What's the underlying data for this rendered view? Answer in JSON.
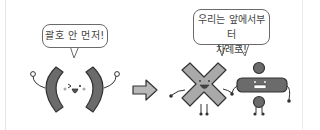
{
  "scene": {
    "left_group": {
      "character": "parentheses-pair",
      "speech": "괄호 안 먼저!"
    },
    "arrow": "right-arrow",
    "right_group": {
      "characters": [
        "multiplication-sign",
        "division-sign"
      ],
      "speech_line1": "우리는 앞에서부터",
      "speech_line2": "차례로!"
    },
    "colors": {
      "character_fill": "#6b6b6b",
      "x_fill": "#a9a9a9",
      "arrow_fill": "#b8b8b8",
      "outline": "#333333",
      "text": "#444444"
    }
  }
}
